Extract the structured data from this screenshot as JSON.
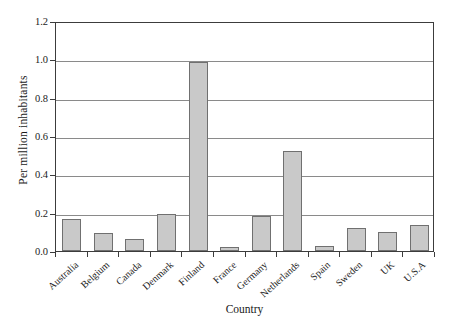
{
  "chart_data": {
    "type": "bar",
    "title": "",
    "xlabel": "Country",
    "ylabel": "Per million inhabitants",
    "categories": [
      "Australia",
      "Belgium",
      "Canada",
      "Denmark",
      "Finland",
      "France",
      "Germany",
      "Netherlands",
      "Spain",
      "Sweden",
      "UK",
      "U.S.A"
    ],
    "values": [
      0.165,
      0.095,
      0.065,
      0.195,
      0.985,
      0.02,
      0.185,
      0.52,
      0.025,
      0.12,
      0.1,
      0.135
    ],
    "ylim": [
      0.0,
      1.2
    ],
    "ytick_labels": [
      "1.2",
      "1.0",
      "0.8",
      "0.6",
      "0.4",
      "0.2",
      "0.0"
    ],
    "ytick_values": [
      1.2,
      1.0,
      0.8,
      0.6,
      0.4,
      0.2,
      0.0
    ],
    "grid": true,
    "legend": "none",
    "bar_fill_color": "#c9c9c9",
    "bar_border_color": "#707070",
    "axis_color": "#3c3c3c",
    "gridline_color": "#8a8a8a"
  }
}
